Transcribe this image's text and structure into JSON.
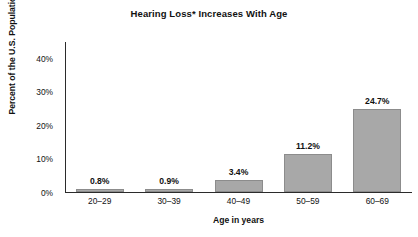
{
  "chart_data": {
    "type": "bar",
    "title": "Hearing Loss* Increases With Age",
    "xlabel": "Age in years",
    "ylabel": "Percent of the U.S. Population",
    "categories": [
      "20–29",
      "30–39",
      "40–49",
      "50–59",
      "60–69"
    ],
    "values": [
      0.8,
      0.9,
      3.4,
      11.2,
      24.7
    ],
    "value_labels": [
      "0.8%",
      "0.9%",
      "3.4%",
      "11.2%",
      "24.7%"
    ],
    "ylim": [
      0,
      45
    ],
    "ytick_values": [
      0,
      10,
      20,
      30,
      40
    ],
    "ytick_labels": [
      "0%",
      "10%",
      "20%",
      "30%",
      "40%"
    ],
    "grid": false,
    "legend": "none",
    "bar_color": "#a8a8a8",
    "bar_edge_color": "#8c8c8c",
    "axis_color": "#2b2b2b",
    "background_color": "#ffffff"
  }
}
